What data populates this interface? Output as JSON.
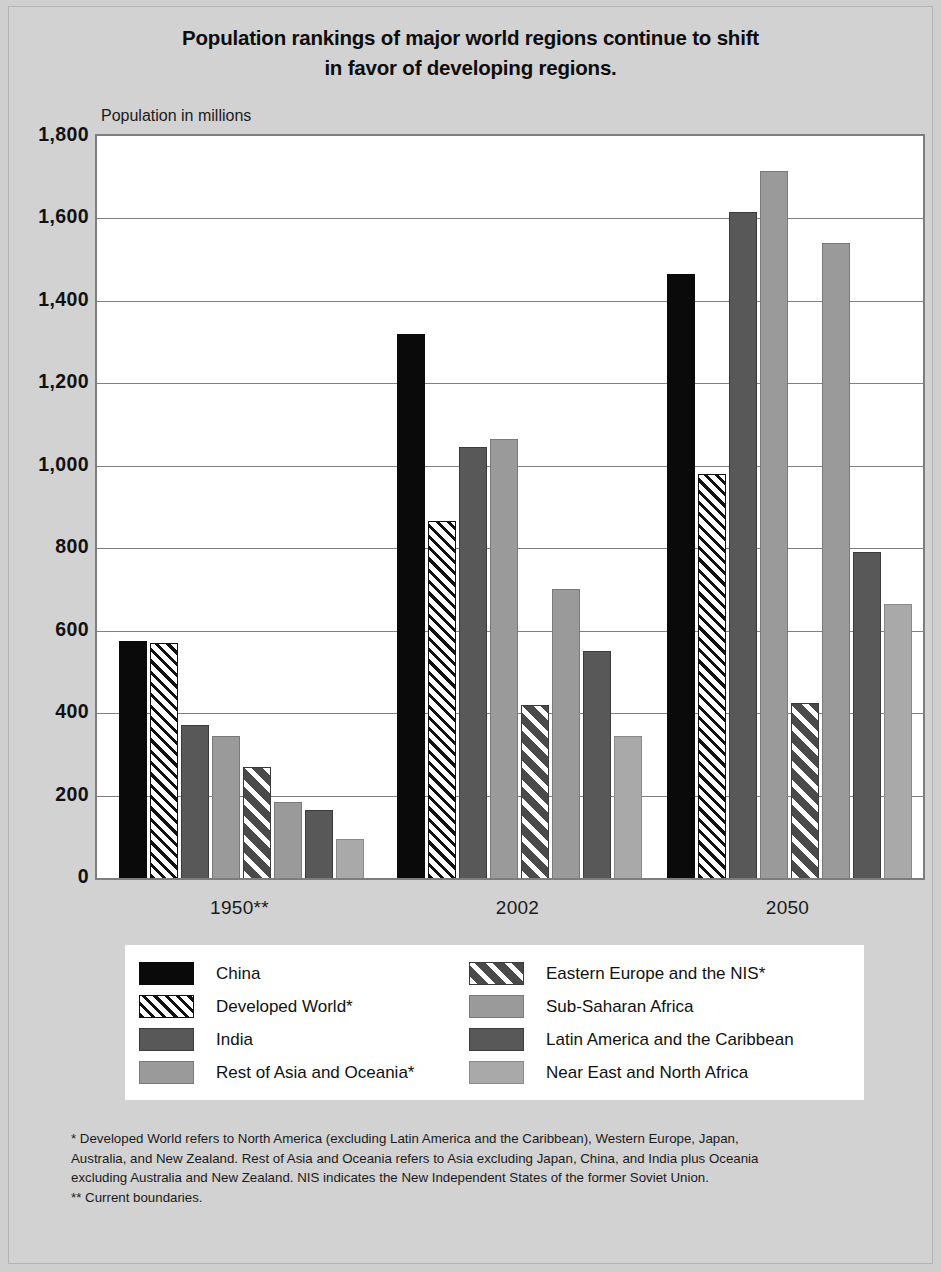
{
  "title": "Population rankings of major world regions continue to shift in favor of developing regions.",
  "title_line_1": "Population rankings of major world regions continue to shift",
  "title_line_2": "in favor of developing regions.",
  "axis_note": "Population in millions",
  "footnotes": {
    "line1": "* Developed World refers to North America (excluding Latin America and the Caribbean), Western Europe, Japan,",
    "line2": "Australia, and New Zealand.  Rest of Asia and Oceania refers to Asia excluding Japan, China, and India plus Oceania",
    "line3": "excluding Australia and New Zealand.  NIS indicates the New Independent States of the former Soviet Union.",
    "line4": "** Current boundaries."
  },
  "legend": {
    "left_column": [
      {
        "label": "China",
        "style": "solid-black",
        "icon": "legend-swatch-solid-black"
      },
      {
        "label": "Developed World*",
        "style": "hatch-light",
        "icon": "legend-swatch-hatch-light"
      },
      {
        "label": "India",
        "style": "dark-gray",
        "icon": "legend-swatch-dark-gray"
      },
      {
        "label": "Rest of Asia and Oceania*",
        "style": "mid-gray",
        "icon": "legend-swatch-mid-gray"
      }
    ],
    "right_column": [
      {
        "label": "Eastern Europe and the NIS*",
        "style": "hatch-dark",
        "icon": "legend-swatch-hatch-dark"
      },
      {
        "label": "Sub-Saharan Africa",
        "style": "mid-gray",
        "icon": "legend-swatch-mid-gray"
      },
      {
        "label": "Latin America and the Caribbean",
        "style": "dark-gray",
        "icon": "legend-swatch-dark-gray"
      },
      {
        "label": "Near East and North Africa",
        "style": "light-gray",
        "icon": "legend-swatch-light-gray"
      }
    ]
  },
  "chart_data": {
    "type": "bar",
    "title": "Population rankings of major world regions continue to shift in favor of developing regions.",
    "xlabel": "",
    "ylabel": "Population in millions",
    "ylim": [
      0,
      1800
    ],
    "yticks": [
      1800,
      1600,
      1400,
      1200,
      1000,
      800,
      600,
      400,
      200,
      0
    ],
    "ytick_labels": [
      "1,800",
      "1,600",
      "1,400",
      "1,200",
      "1,000",
      "800",
      "600",
      "400",
      "200",
      "0"
    ],
    "grid": true,
    "legend_position": "bottom",
    "categories": [
      "1950**",
      "2002",
      "2050"
    ],
    "series": [
      {
        "name": "China",
        "style": "solid-black",
        "color": "#0a0a0a",
        "values": [
          575,
          1320,
          1465
        ]
      },
      {
        "name": "Developed World*",
        "style": "hatch-light",
        "color": "#ffffff",
        "values": [
          570,
          865,
          980
        ]
      },
      {
        "name": "India",
        "style": "dark-gray",
        "color": "#585858",
        "values": [
          370,
          1045,
          1615
        ]
      },
      {
        "name": "Rest of Asia and Oceania*",
        "style": "mid-gray",
        "color": "#9a9a9a",
        "values": [
          345,
          1065,
          1715
        ]
      },
      {
        "name": "Eastern Europe and the NIS*",
        "style": "hatch-dark",
        "color": "#4a4a4a",
        "values": [
          270,
          420,
          425
        ]
      },
      {
        "name": "Sub-Saharan Africa",
        "style": "mid-gray",
        "color": "#9a9a9a",
        "values": [
          185,
          700,
          1540
        ]
      },
      {
        "name": "Latin America and the Caribbean",
        "style": "dark-gray",
        "color": "#585858",
        "values": [
          165,
          550,
          790
        ]
      },
      {
        "name": "Near East and North Africa",
        "style": "light-gray",
        "color": "#a9a9a9",
        "values": [
          95,
          345,
          665
        ]
      }
    ]
  }
}
